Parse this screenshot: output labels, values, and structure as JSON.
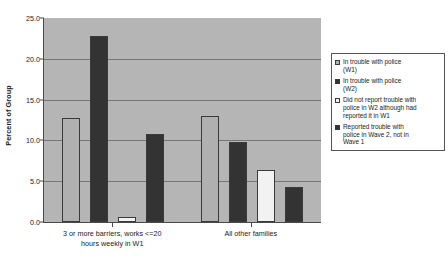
{
  "chart_data": {
    "type": "bar",
    "title": "",
    "xlabel": "",
    "ylabel": "Percent of Group",
    "ylim": [
      0.0,
      25.0
    ],
    "ytick_step": 5.0,
    "ytick_labels": [
      "25.0",
      "20.0",
      "15.0",
      "10.0",
      "5.0",
      "0.0"
    ],
    "ytick_values": [
      25.0,
      20.0,
      15.0,
      10.0,
      5.0,
      0.0
    ],
    "grid": "horizontal",
    "legend_position": "right-outside",
    "plot_background": "#b5b5b5",
    "categories": [
      "3 or more barriers, works <=20 hours weekly in W1",
      "All other families"
    ],
    "category_lines": [
      [
        "3 or more barriers, works <=20",
        "hours weekly in W1"
      ],
      [
        "All other families"
      ]
    ],
    "series": [
      {
        "name": "In  trouble with police (W1)",
        "legend_lines": [
          "In  trouble with police",
          "(W1)"
        ],
        "color": "#b0b0b0",
        "values": [
          12.8,
          13.0
        ]
      },
      {
        "name": "In trouble with police (W2)",
        "legend_lines": [
          "In trouble with police",
          "(W2)"
        ],
        "color": "#333333",
        "values": [
          22.8,
          9.8
        ]
      },
      {
        "name": "Did not report trouble with police in W2 although had reported it in W1",
        "legend_lines": [
          "Did not report trouble with",
          "police in W2 although had",
          "reported it in W1"
        ],
        "color": "#f2f2f2",
        "values": [
          0.6,
          6.4
        ]
      },
      {
        "name": "Reported trouble with police in Wave 2, not in Wave 1",
        "legend_lines": [
          "Reported trouble with",
          "police in Wave 2, not in",
          "Wave 1"
        ],
        "color": "#333333",
        "values": [
          10.8,
          4.3
        ]
      }
    ]
  }
}
